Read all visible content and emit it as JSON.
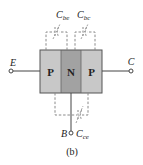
{
  "diagram": {
    "caption": "(b)",
    "regions": [
      {
        "label": "P",
        "color": "#c8c8c8"
      },
      {
        "label": "N",
        "color": "#a2a2a2"
      },
      {
        "label": "P",
        "color": "#c8c8c8"
      }
    ],
    "terminals": {
      "emitter": "E",
      "collector": "C",
      "base": "B"
    },
    "capacitances": {
      "cbe": {
        "main": "C",
        "sub": "be"
      },
      "cbc": {
        "main": "C",
        "sub": "bc"
      },
      "cce": {
        "main": "C",
        "sub": "ce"
      }
    },
    "colors": {
      "border": "#555555",
      "dashed": "#8a8a8a",
      "wire": "#444444"
    }
  }
}
